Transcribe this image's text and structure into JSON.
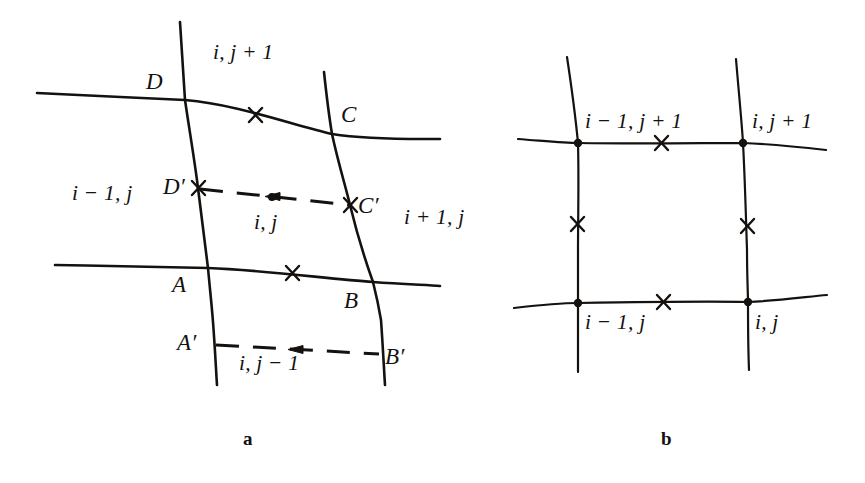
{
  "figure": {
    "title_caption_a": "a",
    "title_caption_b": "b",
    "ink_color": "#14110f",
    "background_color": "#ffffff"
  },
  "panel_a": {
    "caption": "a",
    "corner_labels": [
      {
        "id": "D",
        "text": "D"
      },
      {
        "id": "C",
        "text": "C"
      },
      {
        "id": "A",
        "text": "A"
      },
      {
        "id": "B",
        "text": "B"
      },
      {
        "id": "Dp",
        "text": "D′"
      },
      {
        "id": "Cp",
        "text": "C′"
      },
      {
        "id": "Ap",
        "text": "A′"
      },
      {
        "id": "Bp",
        "text": "B′"
      }
    ],
    "cell_labels": [
      {
        "id": "north",
        "text": "i, j + 1"
      },
      {
        "id": "west",
        "text": "i − 1, j"
      },
      {
        "id": "center",
        "text": "i, j"
      },
      {
        "id": "east",
        "text": "i + 1, j"
      },
      {
        "id": "south",
        "text": "i, j − 1"
      }
    ],
    "cross_marks_count": 4,
    "node_dots_count": 2,
    "dashed_segments": 2,
    "flux_arrows": [
      {
        "id": "arrow-west",
        "direction": "left"
      },
      {
        "id": "arrow-south",
        "direction": "left"
      }
    ]
  },
  "panel_b": {
    "caption": "b",
    "cell_labels": [
      {
        "id": "top-left",
        "text": "i − 1, j + 1"
      },
      {
        "id": "top-right",
        "text": "i, j + 1"
      },
      {
        "id": "bottom-left",
        "text": "i − 1, j"
      },
      {
        "id": "bottom-right",
        "text": "i, j"
      }
    ],
    "cross_marks_count": 4,
    "node_dots_count": 4
  }
}
